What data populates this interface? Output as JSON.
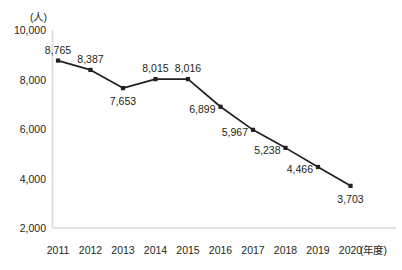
{
  "chart_data": {
    "type": "line",
    "title": "",
    "xlabel": "(年度)",
    "ylabel": "(人)",
    "categories": [
      "2011",
      "2012",
      "2013",
      "2014",
      "2015",
      "2016",
      "2017",
      "2018",
      "2019",
      "2020"
    ],
    "values": [
      8765,
      8387,
      7653,
      8015,
      8016,
      6899,
      5967,
      5238,
      4466,
      3703
    ],
    "data_labels": [
      "8,765",
      "8,387",
      "7,653",
      "8,015",
      "8,016",
      "6,899",
      "5,967",
      "5,238",
      "4,466",
      "3,703"
    ],
    "label_positions": [
      "above",
      "above",
      "below",
      "above",
      "above",
      "left",
      "left",
      "left",
      "left",
      "below"
    ],
    "ylim": [
      2000,
      10000
    ],
    "yticks": [
      10000,
      8000,
      6000,
      4000,
      2000
    ],
    "ytick_labels": [
      "10,000",
      "8,000",
      "6,000",
      "4,000",
      "2,000"
    ],
    "grid": false,
    "legend": null,
    "series_color": "#231f20",
    "marker": "square",
    "axis_color": "#d9d9d9"
  }
}
